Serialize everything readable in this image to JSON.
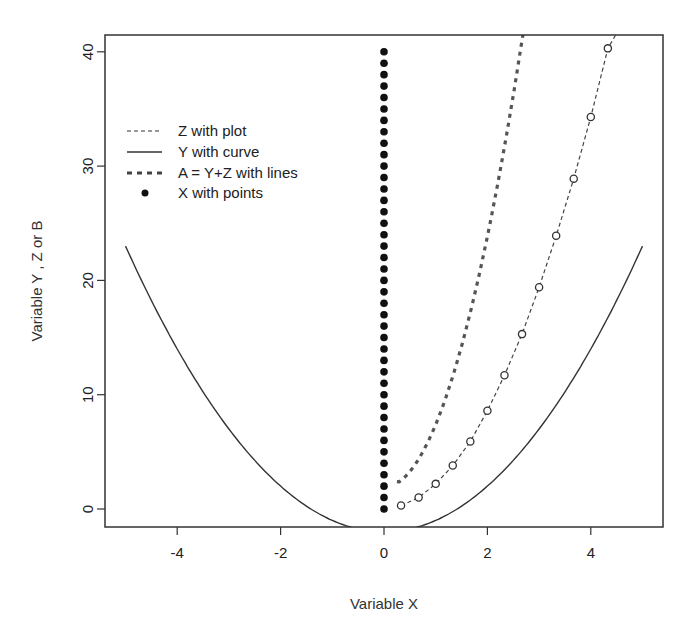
{
  "chart_data": {
    "type": "line",
    "title": "",
    "xlabel": "Variable X",
    "ylabel": "Variable Y , Z or B",
    "xlim": [
      -5.25,
      5.25
    ],
    "ylim": [
      -1.6,
      41.6
    ],
    "x_ticks": [
      -4,
      -2,
      0,
      2,
      4
    ],
    "y_ticks": [
      0,
      10,
      20,
      30,
      40
    ],
    "grid": false,
    "legend_position": "top-left",
    "legend": [
      {
        "label": "Z with plot",
        "style": "dashed"
      },
      {
        "label": "Y with curve",
        "style": "solid"
      },
      {
        "label": "A = Y+Z with lines",
        "style": "thick-dotted"
      },
      {
        "label": "X with points",
        "style": "filled-point"
      }
    ],
    "series": [
      {
        "name": "Z with plot",
        "style": "dashed line with open circles",
        "x": [
          0.33,
          0.67,
          1.0,
          1.33,
          1.67,
          2.0,
          2.33,
          2.67,
          3.0,
          3.33,
          3.67,
          4.0,
          4.33
        ],
        "y": [
          0.3,
          1.0,
          2.2,
          3.8,
          5.9,
          8.6,
          11.7,
          15.3,
          19.4,
          23.9,
          28.9,
          34.3,
          40.3
        ]
      },
      {
        "name": "Y with curve",
        "style": "solid",
        "function": "x^2 - 2",
        "x_range": [
          -5,
          5
        ],
        "y_at_endpoints": 23
      },
      {
        "name": "A = Y+Z with lines",
        "style": "thick dotted",
        "x": [
          0.25,
          0.5,
          0.75,
          1.0,
          1.25,
          1.5,
          1.75,
          2.0,
          2.25,
          2.5,
          2.75
        ],
        "y": [
          2.4,
          3.7,
          5.3,
          7.4,
          9.9,
          12.8,
          16.1,
          19.9,
          24.1,
          28.7,
          41.6
        ]
      },
      {
        "name": "X with points",
        "style": "filled points",
        "x_constant": 0,
        "y": [
          0,
          1,
          2,
          3,
          4,
          5,
          6,
          7,
          8,
          9,
          10,
          11,
          12,
          13,
          14,
          15,
          16,
          17,
          18,
          19,
          20,
          21,
          22,
          23,
          24,
          25,
          26,
          27,
          28,
          29,
          30,
          31,
          32,
          33,
          34,
          35,
          36,
          37,
          38,
          39,
          40
        ]
      }
    ]
  },
  "axes": {
    "xlabel": "Variable X",
    "ylabel": "Variable Y , Z or B",
    "x_tick_labels": [
      "-4",
      "-2",
      "0",
      "2",
      "4"
    ],
    "y_tick_labels": [
      "0",
      "10",
      "20",
      "30",
      "40"
    ]
  },
  "legend": {
    "items": [
      "Z with plot",
      "Y with curve",
      "A = Y+Z with lines",
      "X with points"
    ]
  }
}
